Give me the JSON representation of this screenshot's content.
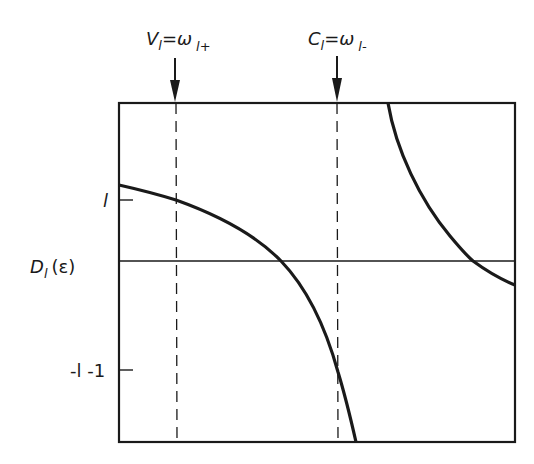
{
  "diagram": {
    "type": "function-plot",
    "y_axis_label": {
      "main": "D",
      "subscript": "l",
      "arg": "(ε)"
    },
    "y_ticks": [
      {
        "label": "l",
        "y_px": 200
      },
      {
        "label": "-l -1",
        "y_px": 370
      }
    ],
    "markers": [
      {
        "label_main": "V",
        "label_sub": "l",
        "eq": "=ω",
        "eq_sub": "l+",
        "x_px": 176
      },
      {
        "label_main": "C",
        "label_sub": "l",
        "eq": "=ω",
        "eq_sub": "l-",
        "x_px": 338
      }
    ],
    "zero_line_y_px": 261,
    "frame": {
      "left": 119,
      "top": 103,
      "right": 515,
      "bottom": 442
    },
    "curves": [
      {
        "name": "lower-branch",
        "description": "decreasing branch crossing zero between markers and diverging downward"
      },
      {
        "name": "upper-branch",
        "description": "decreasing branch from +infinity crossing zero near right edge"
      }
    ],
    "colors": {
      "ink": "#1a1a1a",
      "background": "#ffffff"
    }
  }
}
